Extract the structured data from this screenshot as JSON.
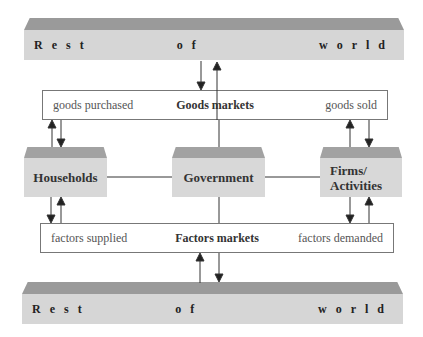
{
  "diagram": {
    "top_bar": {
      "words": [
        "Rest",
        "of",
        "world"
      ]
    },
    "bottom_bar": {
      "words": [
        "Rest",
        "of",
        "world"
      ]
    },
    "goods_markets": {
      "left": "goods purchased",
      "center": "Goods markets",
      "right": "goods sold"
    },
    "factors_markets": {
      "left": "factors supplied",
      "center": "Factors markets",
      "right": "factors demanded"
    },
    "nodes": {
      "households": "Households",
      "government": "Government",
      "firms_line1": "Firms/",
      "firms_line2": "Activities"
    },
    "colors": {
      "bar_top": "#9a9a9a",
      "bar_front": "#d6d6d6",
      "line": "#333333"
    }
  }
}
